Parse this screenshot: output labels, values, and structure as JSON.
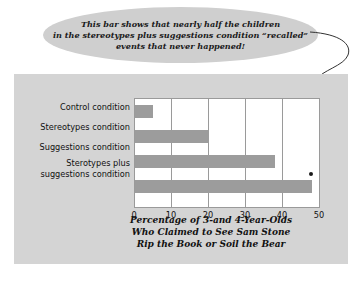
{
  "callout": {
    "text": "This bar shows that nearly half the children\nin the stereotypes plus suggestions condition “recalled”\nevents that never happened!"
  },
  "chart_data": {
    "type": "bar",
    "orientation": "horizontal",
    "title": "",
    "caption": "Percentage of 3-and 4-Year-Olds\nWho Claimed to See Sam Stone\nRip the Book or Soil the Bear",
    "categories": [
      "Control condition",
      "Stereotypes condition",
      "Suggestions condition",
      "Sterotypes plus\nsuggestions condition"
    ],
    "values": [
      5,
      20,
      38,
      48
    ],
    "xlabel": "",
    "ylabel": "",
    "xlim": [
      0,
      50
    ],
    "xticks": [
      "0",
      "10",
      "20",
      "30",
      "40",
      "50"
    ],
    "grid": true,
    "legend": "none",
    "bar_color": "#9c9c9c",
    "panel_color": "#d4d4d4",
    "plot_background": "#ffffff",
    "annotation_target_index": 3
  }
}
